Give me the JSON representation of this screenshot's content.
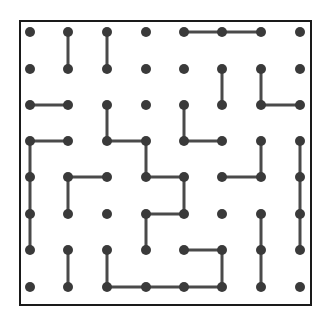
{
  "puzzle": {
    "type": "dot-grid-line-puzzle",
    "rows": 8,
    "cols": 8,
    "colors": {
      "dot": "#3a3a3a",
      "line": "#4a4a4a",
      "frame": "#1a1a1a",
      "background": "#ffffff"
    },
    "frame": {
      "x": 20,
      "y": 21,
      "width": 291,
      "height": 284
    },
    "col_x": [
      30,
      68,
      107,
      146,
      184,
      222,
      261,
      300
    ],
    "row_y": [
      32,
      69,
      105,
      141,
      177,
      214,
      250,
      287
    ],
    "vertical_segments": [
      [
        0,
        1,
        1
      ],
      [
        0,
        1,
        2
      ],
      [
        1,
        2,
        5
      ],
      [
        1,
        2,
        6
      ],
      [
        2,
        3,
        2
      ],
      [
        2,
        3,
        4
      ],
      [
        3,
        4,
        0
      ],
      [
        4,
        5,
        0
      ],
      [
        5,
        6,
        0
      ],
      [
        3,
        4,
        3
      ],
      [
        3,
        4,
        6
      ],
      [
        3,
        4,
        7
      ],
      [
        4,
        5,
        7
      ],
      [
        5,
        6,
        7
      ],
      [
        4,
        5,
        1
      ],
      [
        4,
        5,
        4
      ],
      [
        5,
        6,
        3
      ],
      [
        6,
        7,
        1
      ],
      [
        6,
        7,
        2
      ],
      [
        6,
        7,
        5
      ],
      [
        5,
        6,
        6
      ],
      [
        6,
        7,
        6
      ]
    ],
    "horizontal_segments": [
      [
        0,
        4,
        5
      ],
      [
        0,
        5,
        6
      ],
      [
        2,
        0,
        1
      ],
      [
        2,
        6,
        7
      ],
      [
        3,
        0,
        1
      ],
      [
        3,
        2,
        3
      ],
      [
        3,
        4,
        5
      ],
      [
        4,
        1,
        2
      ],
      [
        4,
        3,
        4
      ],
      [
        4,
        5,
        6
      ],
      [
        5,
        3,
        4
      ],
      [
        6,
        4,
        5
      ],
      [
        7,
        2,
        3
      ],
      [
        7,
        3,
        4
      ],
      [
        7,
        4,
        5
      ]
    ]
  }
}
